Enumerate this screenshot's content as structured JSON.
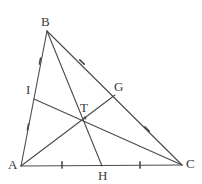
{
  "figure": {
    "stroke_color": "#4a4a4a",
    "label_color": "#3a3a3a",
    "background_color": "#ffffff",
    "stroke_width": 1.1,
    "tick_color": "#4a4a4a"
  },
  "points": {
    "A": {
      "label": "A",
      "x": 21,
      "y": 166,
      "label_x": 8,
      "label_y": 158
    },
    "B": {
      "label": "B",
      "x": 47,
      "y": 31,
      "label_x": 41,
      "label_y": 15
    },
    "C": {
      "label": "C",
      "x": 182,
      "y": 165,
      "label_x": 186,
      "label_y": 157
    },
    "T": {
      "label": "T",
      "x": 85,
      "y": 118,
      "label_x": 80,
      "label_y": 101
    },
    "G": {
      "label": "G",
      "x": 115,
      "y": 95,
      "label_x": 114,
      "label_y": 80
    },
    "H": {
      "label": "H",
      "x": 102,
      "y": 166,
      "label_x": 98,
      "label_y": 169
    },
    "I": {
      "label": "I",
      "x": 34,
      "y": 99,
      "label_x": 26,
      "label_y": 83
    }
  },
  "segments": [
    {
      "name": "side-AB",
      "from": "A",
      "to": "B"
    },
    {
      "name": "side-BC",
      "from": "B",
      "to": "C"
    },
    {
      "name": "side-AC",
      "from": "A",
      "to": "C"
    },
    {
      "name": "median-AG",
      "from": "A",
      "to": "G"
    },
    {
      "name": "median-BH",
      "from": "B",
      "to": "H"
    },
    {
      "name": "median-CI",
      "from": "C",
      "to": "I"
    }
  ],
  "tick_marks": [
    {
      "name": "tick-AB-upper",
      "x": 40,
      "y": 61,
      "angle": 101
    },
    {
      "name": "tick-AB-lower",
      "x": 28,
      "y": 127,
      "angle": 101
    },
    {
      "name": "tick-BC-upper",
      "x": 82,
      "y": 62,
      "angle": 44
    },
    {
      "name": "tick-BC-lower",
      "x": 147,
      "y": 129,
      "angle": 44
    },
    {
      "name": "tick-AC-left",
      "x": 62,
      "y": 165,
      "angle": 90
    },
    {
      "name": "tick-AC-right",
      "x": 140,
      "y": 165,
      "angle": 90
    }
  ]
}
